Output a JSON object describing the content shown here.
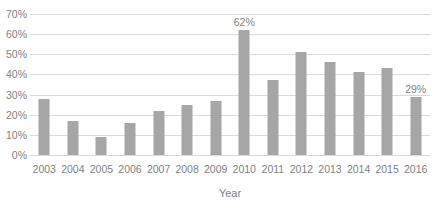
{
  "chart_data": {
    "type": "bar",
    "title": "",
    "xlabel": "Year",
    "ylabel": "",
    "ylim": [
      0,
      70
    ],
    "ytick_labels": [
      "0%",
      "10%",
      "20%",
      "30%",
      "40%",
      "50%",
      "60%",
      "70%"
    ],
    "ytick_values": [
      0,
      10,
      20,
      30,
      40,
      50,
      60,
      70
    ],
    "grid": true,
    "legend": "none",
    "bar_color": "#a6a6a6",
    "grid_color": "#d9d9d9",
    "tick_color": "#7f7f7f",
    "categories": [
      "2003",
      "2004",
      "2005",
      "2006",
      "2007",
      "2008",
      "2009",
      "2010",
      "2011",
      "2012",
      "2013",
      "2014",
      "2015",
      "2016"
    ],
    "values": [
      28,
      17,
      9,
      16,
      22,
      25,
      27,
      62,
      37,
      51,
      46,
      41,
      43,
      29
    ],
    "data_labels": [
      null,
      null,
      null,
      null,
      null,
      null,
      null,
      "62%",
      null,
      null,
      null,
      null,
      null,
      "29%"
    ]
  }
}
